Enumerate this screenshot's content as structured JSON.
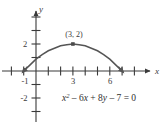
{
  "figure": {
    "name": "parabola-graph",
    "width": 166,
    "height": 125,
    "background_color": "#ffffff",
    "ink_color": "#3a3a3a",
    "curve_color": "#555555"
  },
  "axes": {
    "x_axis": {
      "label": "x",
      "label_position": {
        "x": 158,
        "y": 72
      },
      "line": {
        "x1": 2,
        "y1": 71,
        "x2": 152,
        "y2": 71
      },
      "arrow": "right",
      "origin_px": {
        "x": 36,
        "y": 71
      },
      "unit_px": 12.3,
      "tick_values": [
        -2,
        -1,
        1,
        2,
        3,
        4,
        5,
        6,
        7,
        8
      ],
      "tick_labels": [
        {
          "text": "-1",
          "value": -1,
          "x": 25,
          "y": 80
        },
        {
          "text": "3",
          "value": 3,
          "x": 73,
          "y": 80
        },
        {
          "text": "6",
          "value": 6,
          "x": 110,
          "y": 80
        }
      ]
    },
    "y_axis": {
      "label": "y",
      "label_position": {
        "x": 40,
        "y": 8
      },
      "line": {
        "x1": 36,
        "y1": 10,
        "x2": 36,
        "y2": 120
      },
      "arrow": "up",
      "unit_px": 13.5,
      "tick_values": [
        4,
        3,
        2,
        1,
        -1,
        -2,
        -3
      ],
      "tick_labels": [
        {
          "text": "2",
          "value": 2,
          "x": 23,
          "y": 45
        },
        {
          "text": "-2",
          "value": -2,
          "x": 21,
          "y": 99
        }
      ]
    }
  },
  "chart_data": {
    "type": "line",
    "title": "",
    "subtitle": "",
    "xlabel": "x",
    "ylabel": "y",
    "xlim": [
      -3,
      9
    ],
    "ylim": [
      -3,
      4
    ],
    "grid": false,
    "legend": false,
    "equation_display": "x² − 6x + 8y − 7 = 0",
    "equation_terms": [
      {
        "text": "x",
        "italic": true
      },
      {
        "text": "2",
        "superscript": true
      },
      {
        "text": " – ",
        "italic": false
      },
      {
        "text": "6x",
        "italic": true
      },
      {
        "text": " + ",
        "italic": false
      },
      {
        "text": "8y",
        "italic": true
      },
      {
        "text": " – ",
        "italic": false
      },
      {
        "text": "7 = 0",
        "italic": false
      }
    ],
    "equation_position": {
      "x": 62,
      "y": 101
    },
    "curve": {
      "name": "parabola",
      "form": "y = (-x^2 + 6x + 7) / 8",
      "vertex": [
        3,
        2
      ],
      "x_intercepts": [
        -1,
        7
      ],
      "y_intercept": 0.875,
      "x_range": [
        -1.0,
        7.0
      ],
      "arrow_start": true,
      "arrow_end": true,
      "x": [
        -1.0,
        -0.5,
        0.0,
        0.5,
        1.0,
        1.5,
        2.0,
        2.5,
        3.0,
        3.5,
        4.0,
        4.5,
        5.0,
        5.5,
        6.0,
        6.5,
        7.0
      ],
      "y": [
        0.0,
        0.4375,
        0.875,
        1.2188,
        1.5,
        1.6875,
        1.875,
        1.9375,
        2.0,
        1.9375,
        1.875,
        1.6875,
        1.5,
        1.2188,
        0.875,
        0.4375,
        0.0
      ]
    },
    "annotations": [
      {
        "name": "vertex-point",
        "label": "(3, 2)",
        "point": [
          3,
          2
        ],
        "marker": "square",
        "marker_px": {
          "x": 73,
          "y": 44
        },
        "label_px": {
          "x": 62,
          "y": 35
        }
      }
    ]
  }
}
